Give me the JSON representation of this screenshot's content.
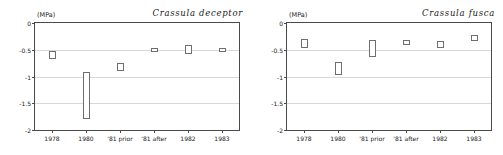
{
  "figure": {
    "unit_label": "(MPa)",
    "y_ticks": [
      "0",
      "-0.5",
      "-1",
      "-1.5",
      "-2"
    ],
    "categories": [
      "1978",
      "1980",
      "'81 prior",
      "'81 after",
      "1982",
      "1983"
    ]
  },
  "chart_data": [
    {
      "type": "bar",
      "title": "Crassula deceptor",
      "xlabel": "",
      "ylabel": "(MPa)",
      "ylim": [
        -2,
        0
      ],
      "yticks": [
        0,
        -0.5,
        -1,
        -1.5,
        -2
      ],
      "grid": true,
      "legend": "none",
      "categories": [
        "1978",
        "1980",
        "'81 prior",
        "'81 after",
        "1982",
        "1983"
      ],
      "series": [
        {
          "name": "range_top",
          "values": [
            -0.52,
            -0.92,
            -0.75,
            -0.46,
            -0.42,
            -0.46
          ]
        },
        {
          "name": "range_bottom",
          "values": [
            -0.67,
            -1.8,
            -0.9,
            -0.55,
            -0.58,
            -0.54
          ]
        }
      ]
    },
    {
      "type": "bar",
      "title": "Crassula fusca",
      "xlabel": "",
      "ylabel": "(MPa)",
      "ylim": [
        -2,
        0
      ],
      "yticks": [
        0,
        -0.5,
        -1,
        -1.5,
        -2
      ],
      "grid": true,
      "legend": "none",
      "categories": [
        "1978",
        "1980",
        "'81 prior",
        "'81 after",
        "1982",
        "1983"
      ],
      "series": [
        {
          "name": "range_top",
          "values": [
            -0.3,
            -0.72,
            -0.32,
            -0.31,
            -0.33,
            -0.22
          ]
        },
        {
          "name": "range_bottom",
          "values": [
            -0.46,
            -0.98,
            -0.64,
            -0.42,
            -0.46,
            -0.34
          ]
        }
      ]
    }
  ]
}
